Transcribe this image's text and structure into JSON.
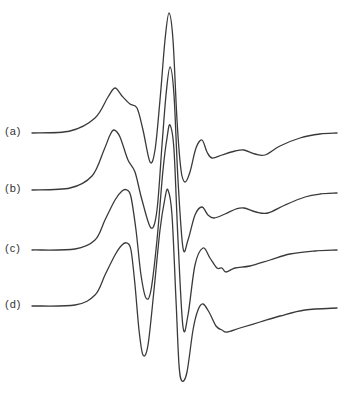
{
  "chart_data": {
    "type": "line",
    "title": "",
    "xlabel": "",
    "ylabel": "",
    "grid": false,
    "legend_position": "none",
    "series": [
      {
        "name": "(a)",
        "label": "(a)",
        "baseline_y": 133,
        "points": [
          [
            32,
            133
          ],
          [
            70,
            131
          ],
          [
            95,
            118
          ],
          [
            108,
            97
          ],
          [
            115,
            88
          ],
          [
            122,
            96
          ],
          [
            130,
            104
          ],
          [
            137,
            108
          ],
          [
            143,
            130
          ],
          [
            150,
            162
          ],
          [
            155,
            150
          ],
          [
            160,
            100
          ],
          [
            165,
            40
          ],
          [
            169,
            13
          ],
          [
            173,
            40
          ],
          [
            177,
            120
          ],
          [
            181,
            170
          ],
          [
            185,
            182
          ],
          [
            190,
            172
          ],
          [
            196,
            148
          ],
          [
            202,
            140
          ],
          [
            207,
            152
          ],
          [
            212,
            158
          ],
          [
            222,
            155
          ],
          [
            235,
            151
          ],
          [
            244,
            150
          ],
          [
            255,
            154
          ],
          [
            265,
            155
          ],
          [
            280,
            146
          ],
          [
            300,
            138
          ],
          [
            320,
            134
          ],
          [
            337,
            133
          ]
        ]
      },
      {
        "name": "(b)",
        "label": "(b)",
        "baseline_y": 190,
        "points": [
          [
            32,
            190
          ],
          [
            70,
            188
          ],
          [
            92,
            176
          ],
          [
            104,
            150
          ],
          [
            110,
            135
          ],
          [
            114,
            130
          ],
          [
            120,
            137
          ],
          [
            128,
            160
          ],
          [
            135,
            172
          ],
          [
            142,
            200
          ],
          [
            151,
            228
          ],
          [
            157,
            210
          ],
          [
            162,
            145
          ],
          [
            166,
            95
          ],
          [
            170,
            67
          ],
          [
            174,
            95
          ],
          [
            178,
            180
          ],
          [
            183,
            248
          ],
          [
            188,
            240
          ],
          [
            195,
            215
          ],
          [
            202,
            207
          ],
          [
            208,
            215
          ],
          [
            214,
            218
          ],
          [
            225,
            214
          ],
          [
            236,
            209
          ],
          [
            244,
            208
          ],
          [
            256,
            212
          ],
          [
            268,
            213
          ],
          [
            285,
            205
          ],
          [
            305,
            197
          ],
          [
            320,
            194
          ],
          [
            337,
            193
          ]
        ]
      },
      {
        "name": "(c)",
        "label": "(c)",
        "baseline_y": 250,
        "points": [
          [
            32,
            250
          ],
          [
            75,
            249
          ],
          [
            95,
            240
          ],
          [
            105,
            220
          ],
          [
            115,
            200
          ],
          [
            122,
            191
          ],
          [
            127,
            190
          ],
          [
            131,
            197
          ],
          [
            136,
            230
          ],
          [
            141,
            275
          ],
          [
            146,
            298
          ],
          [
            151,
            290
          ],
          [
            157,
            240
          ],
          [
            163,
            170
          ],
          [
            167,
            138
          ],
          [
            170,
            125
          ],
          [
            174,
            150
          ],
          [
            178,
            240
          ],
          [
            183,
            327
          ],
          [
            188,
            315
          ],
          [
            195,
            265
          ],
          [
            203,
            248
          ],
          [
            210,
            258
          ],
          [
            217,
            268
          ],
          [
            222,
            268
          ],
          [
            226,
            272
          ],
          [
            235,
            268
          ],
          [
            250,
            266
          ],
          [
            270,
            260
          ],
          [
            290,
            254
          ],
          [
            315,
            251
          ],
          [
            337,
            250
          ]
        ]
      },
      {
        "name": "(d)",
        "label": "(d)",
        "baseline_y": 306,
        "points": [
          [
            32,
            306
          ],
          [
            75,
            305
          ],
          [
            95,
            295
          ],
          [
            105,
            275
          ],
          [
            115,
            255
          ],
          [
            122,
            245
          ],
          [
            127,
            243
          ],
          [
            131,
            250
          ],
          [
            135,
            285
          ],
          [
            139,
            330
          ],
          [
            143,
            355
          ],
          [
            148,
            345
          ],
          [
            154,
            290
          ],
          [
            160,
            230
          ],
          [
            165,
            198
          ],
          [
            168,
            190
          ],
          [
            172,
            215
          ],
          [
            176,
            300
          ],
          [
            179,
            365
          ],
          [
            182,
            381
          ],
          [
            187,
            372
          ],
          [
            193,
            330
          ],
          [
            198,
            310
          ],
          [
            203,
            304
          ],
          [
            209,
            312
          ],
          [
            216,
            326
          ],
          [
            222,
            330
          ],
          [
            227,
            332
          ],
          [
            240,
            328
          ],
          [
            260,
            322
          ],
          [
            280,
            316
          ],
          [
            305,
            310
          ],
          [
            337,
            308
          ]
        ]
      }
    ]
  },
  "labels": {
    "a": "(a)",
    "b": "(b)",
    "c": "(c)",
    "d": "(d)"
  },
  "colors": {
    "line": "#3a3a3a",
    "background": "#ffffff"
  }
}
